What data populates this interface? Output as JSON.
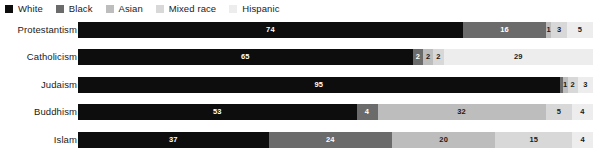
{
  "legend": {
    "position": "top-left",
    "items": [
      {
        "label": "White",
        "color": "#0d0d0d"
      },
      {
        "label": "Black",
        "color": "#6b6b6b"
      },
      {
        "label": "Asian",
        "color": "#bdbdbd"
      },
      {
        "label": "Mixed race",
        "color": "#d8d8d8"
      },
      {
        "label": "Hispanic",
        "color": "#ededed"
      }
    ]
  },
  "chart_data": {
    "type": "bar",
    "orientation": "horizontal",
    "stacked": true,
    "normalized": true,
    "title": "",
    "subtitle": "",
    "xlabel": "",
    "ylabel": "",
    "xlim": [
      0,
      100
    ],
    "grid": false,
    "legend_position": "top-left",
    "categories": [
      "Protestantism",
      "Catholicism",
      "Judaism",
      "Buddhism",
      "Islam"
    ],
    "series": [
      {
        "name": "White",
        "color": "#0d0d0d",
        "label_color": "#ffffff",
        "values": [
          74,
          65,
          95,
          53,
          37
        ]
      },
      {
        "name": "Black",
        "color": "#6b6b6b",
        "label_color": "#ffffff",
        "values": [
          16,
          2,
          0.6,
          4,
          24
        ]
      },
      {
        "name": "Asian",
        "color": "#bdbdbd",
        "label_color": "#1a1a1a",
        "values": [
          1,
          2,
          1,
          32,
          20
        ]
      },
      {
        "name": "Mixed race",
        "color": "#d8d8d8",
        "label_color": "#1a1a1a",
        "values": [
          3,
          2,
          2,
          5,
          15
        ]
      },
      {
        "name": "Hispanic",
        "color": "#ededed",
        "label_color": "#1a1a1a",
        "values": [
          5,
          29,
          3,
          4,
          4
        ]
      }
    ],
    "rows": [
      {
        "category": "Protestantism",
        "segments": [
          {
            "series": "White",
            "value": 74,
            "display": "74",
            "color": "#0d0d0d",
            "label_color": "#ffffff"
          },
          {
            "series": "Black",
            "value": 16,
            "display": "16",
            "color": "#6b6b6b",
            "label_color": "#ffffff"
          },
          {
            "series": "Asian",
            "value": 1,
            "display": "1",
            "color": "#bdbdbd",
            "label_color": "#1a1a1a"
          },
          {
            "series": "Mixed race",
            "value": 3,
            "display": "3",
            "color": "#d8d8d8",
            "label_color": "#1a1a1a"
          },
          {
            "series": "Hispanic",
            "value": 5,
            "display": "5",
            "color": "#ededed",
            "label_color": "#1a1a1a"
          }
        ]
      },
      {
        "category": "Catholicism",
        "segments": [
          {
            "series": "White",
            "value": 65,
            "display": "65",
            "color": "#0d0d0d",
            "label_color": "#ffffff"
          },
          {
            "series": "Black",
            "value": 2,
            "display": "2",
            "color": "#6b6b6b",
            "label_color": "#ffffff"
          },
          {
            "series": "Asian",
            "value": 2,
            "display": "2",
            "color": "#bdbdbd",
            "label_color": "#1a1a1a"
          },
          {
            "series": "Mixed race",
            "value": 2,
            "display": "2",
            "color": "#d8d8d8",
            "label_color": "#1a1a1a"
          },
          {
            "series": "Hispanic",
            "value": 29,
            "display": "29",
            "color": "#ededed",
            "label_color": "#1a1a1a"
          }
        ]
      },
      {
        "category": "Judaism",
        "segments": [
          {
            "series": "White",
            "value": 95,
            "display": "95",
            "color": "#0d0d0d",
            "label_color": "#ffffff"
          },
          {
            "series": "Black",
            "value": 0.6,
            "display": "",
            "color": "#6b6b6b",
            "label_color": "#ffffff"
          },
          {
            "series": "Asian",
            "value": 1,
            "display": "1",
            "color": "#bdbdbd",
            "label_color": "#1a1a1a"
          },
          {
            "series": "Mixed race",
            "value": 2,
            "display": "2",
            "color": "#d8d8d8",
            "label_color": "#1a1a1a"
          },
          {
            "series": "Hispanic",
            "value": 3,
            "display": "3",
            "color": "#ededed",
            "label_color": "#1a1a1a"
          }
        ]
      },
      {
        "category": "Buddhism",
        "segments": [
          {
            "series": "White",
            "value": 53,
            "display": "53",
            "color": "#0d0d0d",
            "label_color": "#ffffff"
          },
          {
            "series": "Black",
            "value": 4,
            "display": "4",
            "color": "#6b6b6b",
            "label_color": "#ffffff"
          },
          {
            "series": "Asian",
            "value": 32,
            "display": "32",
            "color": "#bdbdbd",
            "label_color": "#1a1a1a"
          },
          {
            "series": "Mixed race",
            "value": 5,
            "display": "5",
            "color": "#d8d8d8",
            "label_color": "#1a1a1a"
          },
          {
            "series": "Hispanic",
            "value": 4,
            "display": "4",
            "color": "#ededed",
            "label_color": "#1a1a1a"
          }
        ]
      },
      {
        "category": "Islam",
        "segments": [
          {
            "series": "White",
            "value": 37,
            "display": "37",
            "color": "#0d0d0d",
            "label_color": "#ffffff"
          },
          {
            "series": "Black",
            "value": 24,
            "display": "24",
            "color": "#6b6b6b",
            "label_color": "#ffffff"
          },
          {
            "series": "Asian",
            "value": 20,
            "display": "20",
            "color": "#bdbdbd",
            "label_color": "#1a1a1a"
          },
          {
            "series": "Mixed race",
            "value": 15,
            "display": "15",
            "color": "#d8d8d8",
            "label_color": "#1a1a1a"
          },
          {
            "series": "Hispanic",
            "value": 4,
            "display": "4",
            "color": "#ededed",
            "label_color": "#1a1a1a"
          }
        ]
      }
    ]
  }
}
